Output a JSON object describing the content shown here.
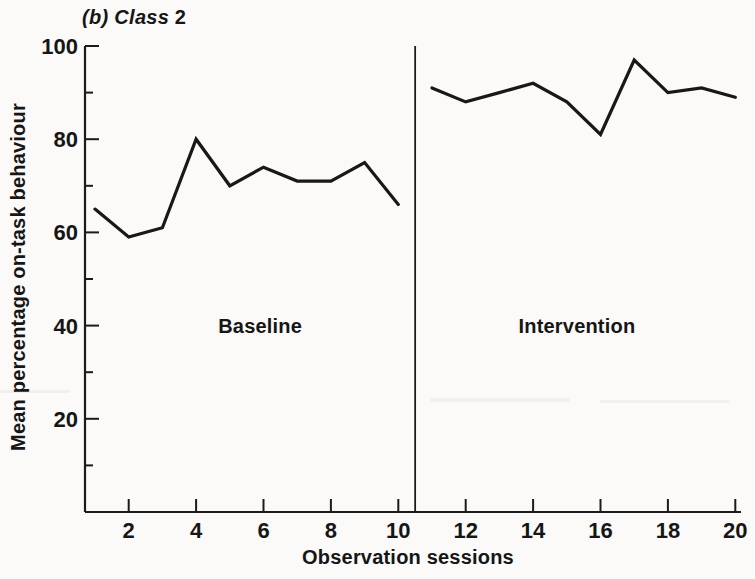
{
  "title": {
    "italic": "(b) Class",
    "plain": "2",
    "full": "(b) Class 2"
  },
  "colors": {
    "background": "#fbfaf8",
    "ink": "#1b1b1b"
  },
  "chart_data": {
    "type": "line",
    "xlabel": "Observation sessions",
    "ylabel": "Mean percentage on-task behaviour",
    "xlim": [
      0.5,
      20.9
    ],
    "ylim": [
      0,
      100
    ],
    "x_ticks": [
      2,
      4,
      6,
      8,
      10,
      12,
      14,
      16,
      18,
      20
    ],
    "y_ticks": [
      20,
      40,
      60,
      80,
      100
    ],
    "y_minor_ticks": [
      10,
      30,
      50,
      70,
      90
    ],
    "grid": false,
    "legend": false,
    "phase_divider_x": 10.5,
    "series": [
      {
        "name": "Baseline",
        "x": [
          1,
          2,
          3,
          4,
          5,
          6,
          7,
          8,
          9,
          10
        ],
        "values": [
          65,
          59,
          61,
          80,
          70,
          74,
          71,
          71,
          75,
          66
        ]
      },
      {
        "name": "Intervention",
        "x": [
          11,
          12,
          13,
          14,
          15,
          16,
          17,
          18,
          19,
          20
        ],
        "values": [
          91,
          88,
          90,
          92,
          88,
          81,
          97,
          90,
          91,
          89
        ]
      }
    ],
    "annotations": [
      {
        "text": "Baseline",
        "x": 5.9,
        "y": 40
      },
      {
        "text": "Intervention",
        "x": 15.3,
        "y": 40
      }
    ]
  }
}
